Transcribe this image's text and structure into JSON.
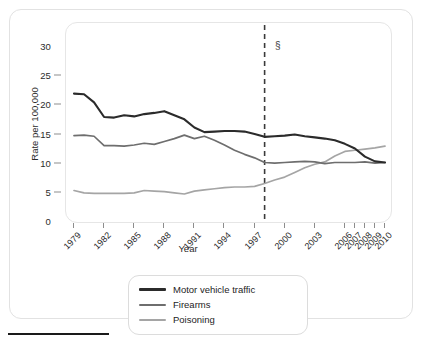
{
  "chart_data": {
    "type": "line",
    "title": "",
    "subtitle": "",
    "xlabel": "Year",
    "ylabel": "Rate per 100,000",
    "xlim": [
      1979,
      2010
    ],
    "ylim": [
      0,
      30
    ],
    "yticks": [
      0,
      5,
      10,
      15,
      20,
      25,
      30
    ],
    "ytick_labels": [
      "0",
      "5",
      "10",
      "15",
      "20",
      "25",
      "30"
    ],
    "xticks": [
      1979,
      1982,
      1985,
      1988,
      1991,
      1994,
      1997,
      2000,
      2003,
      2006,
      2007,
      2008,
      2009,
      2010
    ],
    "xtick_labels": [
      "1979",
      "1982",
      "1985",
      "1988",
      "1991",
      "1994",
      "1997",
      "2000",
      "2003",
      "2006",
      "2007",
      "2008",
      "2009",
      "2010"
    ],
    "grid": false,
    "legend_position": "bottom-center",
    "x": [
      1979,
      1980,
      1981,
      1982,
      1983,
      1984,
      1985,
      1986,
      1987,
      1988,
      1989,
      1990,
      1991,
      1992,
      1993,
      1994,
      1995,
      1996,
      1997,
      1998,
      1999,
      2000,
      2001,
      2002,
      2003,
      2004,
      2005,
      2006,
      2007,
      2008,
      2009,
      2010
    ],
    "series": [
      {
        "name": "Motor vehicle traffic",
        "color": "#2b2b2b",
        "width": 2.1,
        "values": [
          22.0,
          21.9,
          20.5,
          18.0,
          17.9,
          18.3,
          18.1,
          18.5,
          18.7,
          19.0,
          18.3,
          17.6,
          16.2,
          15.4,
          15.5,
          15.6,
          15.6,
          15.5,
          15.1,
          14.6,
          14.7,
          14.8,
          15.0,
          14.7,
          14.5,
          14.3,
          14.0,
          13.4,
          12.6,
          11.2,
          10.4,
          10.2
        ]
      },
      {
        "name": "Firearms",
        "color": "#6e6e6e",
        "width": 1.7,
        "values": [
          14.8,
          14.9,
          14.7,
          13.1,
          13.1,
          13.0,
          13.2,
          13.5,
          13.3,
          13.8,
          14.3,
          14.9,
          14.3,
          14.7,
          14.0,
          13.2,
          12.3,
          11.6,
          11.0,
          10.2,
          10.1,
          10.2,
          10.3,
          10.4,
          10.3,
          10.0,
          10.2,
          10.2,
          10.2,
          10.3,
          10.1,
          10.2
        ]
      },
      {
        "name": "Poisoning",
        "color": "#a5a5a5",
        "width": 1.7,
        "values": [
          5.4,
          5.0,
          4.9,
          4.9,
          4.9,
          4.9,
          5.0,
          5.4,
          5.3,
          5.2,
          5.0,
          4.8,
          5.3,
          5.5,
          5.7,
          5.9,
          6.0,
          6.0,
          6.1,
          6.6,
          7.2,
          7.7,
          8.5,
          9.3,
          9.9,
          10.3,
          11.3,
          12.1,
          12.3,
          12.5,
          12.7,
          13.0
        ]
      }
    ],
    "annotations": [
      {
        "name": "coding-change-marker",
        "symbol": "§",
        "x": 1998,
        "style": "vertical dashed line"
      }
    ]
  },
  "legend": {
    "items": [
      {
        "label": "Motor vehicle traffic",
        "color": "#2b2b2b",
        "thickness": "3px"
      },
      {
        "label": "Firearms",
        "color": "#6e6e6e",
        "thickness": "2px"
      },
      {
        "label": "Poisoning",
        "color": "#a5a5a5",
        "thickness": "2px"
      }
    ]
  },
  "axis": {
    "y_title": "Rate per 100,000",
    "x_title": "Year"
  },
  "colors": {
    "motor_vehicle_traffic": "#2b2b2b",
    "firearms": "#6e6e6e",
    "poisoning": "#a5a5a5",
    "axis": "#8d8d8d",
    "frame": "#e2e2e2",
    "rule": "#1a1a1a"
  }
}
